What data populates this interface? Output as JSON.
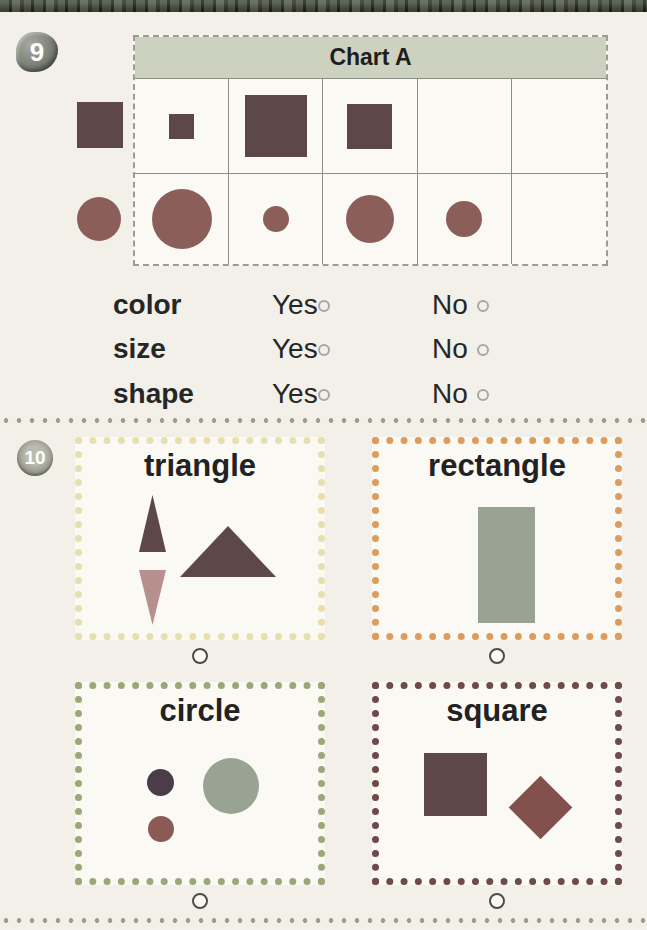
{
  "q9": {
    "badge": "9",
    "chart_title": "Chart A",
    "header_bg": "#ccd2bf",
    "row_labels": [
      {
        "shape": "square",
        "color": "#5d4747",
        "size": 46
      },
      {
        "shape": "circle",
        "color": "#8c5e59",
        "size": 44
      }
    ],
    "table_rows": [
      {
        "shape": "square",
        "color": "#5d4747",
        "sizes": [
          25,
          62,
          45,
          0,
          0
        ]
      },
      {
        "shape": "circle",
        "color": "#8c5e59",
        "sizes": [
          60,
          26,
          48,
          36,
          0
        ]
      }
    ],
    "questions": [
      {
        "label": "color",
        "yes_label": "Yes",
        "no_label": "No"
      },
      {
        "label": "size",
        "yes_label": "Yes",
        "no_label": "No"
      },
      {
        "label": "shape",
        "yes_label": "Yes",
        "no_label": "No"
      }
    ]
  },
  "q10": {
    "badge": "10",
    "boxes": [
      {
        "label": "triangle",
        "border_color": "#e8dfae",
        "shapes": [
          {
            "type": "tri-up",
            "x": 64,
            "y": 58,
            "w": 27,
            "h": 57,
            "color": "#5d4747"
          },
          {
            "type": "tri-down",
            "x": 64,
            "y": 133,
            "w": 27,
            "h": 55,
            "color": "#b5908c"
          },
          {
            "type": "tri-up",
            "x": 105,
            "y": 89,
            "w": 96,
            "h": 51,
            "color": "#5d4747"
          }
        ]
      },
      {
        "label": "rectangle",
        "border_color": "#dd9b5e",
        "shapes": [
          {
            "type": "rect",
            "x": 106,
            "y": 70,
            "w": 57,
            "h": 116,
            "color": "#98a391"
          }
        ]
      },
      {
        "label": "circle",
        "border_color": "#9aa878",
        "shapes": [
          {
            "type": "circle",
            "x": 72,
            "y": 87,
            "w": 27,
            "h": 27,
            "color": "#4a3c49"
          },
          {
            "type": "circle",
            "x": 73,
            "y": 134,
            "w": 26,
            "h": 26,
            "color": "#8c5a55"
          },
          {
            "type": "circle",
            "x": 128,
            "y": 76,
            "w": 56,
            "h": 56,
            "color": "#98a391"
          }
        ]
      },
      {
        "label": "square",
        "border_color": "#6e4a49",
        "shapes": [
          {
            "type": "rect",
            "x": 52,
            "y": 71,
            "w": 63,
            "h": 63,
            "color": "#5d4747"
          },
          {
            "type": "diamond",
            "x": 146,
            "y": 103,
            "w": 45,
            "h": 45,
            "color": "#82504d"
          }
        ]
      }
    ]
  }
}
